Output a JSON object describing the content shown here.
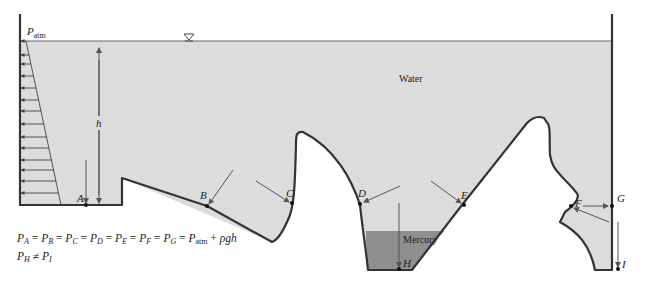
{
  "colors": {
    "water": "#dcdcdc",
    "mercury": "#8f8f8f",
    "wall": "#333333",
    "arrow": "#555555",
    "background": "#ffffff"
  },
  "labels": {
    "patm": "P",
    "patm_sub": "atm",
    "water": "Water",
    "mercury": "Mercury",
    "depth": "h",
    "free_surface_icon": "▽"
  },
  "points": [
    {
      "id": "A",
      "label": "A"
    },
    {
      "id": "B",
      "label": "B"
    },
    {
      "id": "C",
      "label": "C"
    },
    {
      "id": "D",
      "label": "D"
    },
    {
      "id": "E",
      "label": "E"
    },
    {
      "id": "F",
      "label": "F"
    },
    {
      "id": "G",
      "label": "G"
    },
    {
      "id": "H",
      "label": "H"
    },
    {
      "id": "I",
      "label": "I"
    }
  ],
  "equations": {
    "line1": "P_A = P_B = P_C = P_D = P_E = P_F = P_G = P_atm + ρgh",
    "line2": "P_H ≠ P_I",
    "eq_sign": "=",
    "neq_sign": "≠",
    "plus": "+",
    "rho_g_h": "ρgh",
    "P": "P",
    "subs": [
      "A",
      "B",
      "C",
      "D",
      "E",
      "F",
      "G"
    ],
    "atm": "atm",
    "H": "H",
    "I": "I"
  }
}
